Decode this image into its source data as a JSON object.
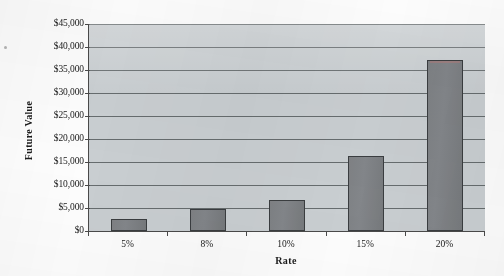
{
  "chart_data": {
    "type": "bar",
    "title": "",
    "subtitle": "",
    "xlabel": "Rate",
    "ylabel": "Future Value",
    "categories": [
      "5%",
      "8%",
      "10%",
      "15%",
      "20%"
    ],
    "values": [
      2600,
      4800,
      6700,
      16300,
      37200
    ],
    "series": [
      {
        "name": "Future Value",
        "values": [
          2600,
          4800,
          6700,
          16300,
          37200
        ]
      }
    ],
    "ylim": [
      0,
      45000
    ],
    "y_tick_values": [
      0,
      5000,
      10000,
      15000,
      20000,
      25000,
      30000,
      35000,
      40000,
      45000
    ],
    "y_tick_labels": [
      "$0",
      "$5,000",
      "$10,000",
      "$15,000",
      "$20,000",
      "$25,000",
      "$30,000",
      "$35,000",
      "$40,000",
      "$45,000"
    ],
    "grid": true,
    "grid_axis": "y",
    "legend": false,
    "legend_position": "none",
    "annotations": [],
    "colors": {
      "bar_fill": "#7f8285",
      "bar_border": "#3a3d40",
      "plot_background": "#c9ced1",
      "gridline": "#555a5d",
      "axis_line": "#4a4a4a",
      "page_background": "#fdfdfd",
      "text": "#1a1a1a"
    }
  }
}
